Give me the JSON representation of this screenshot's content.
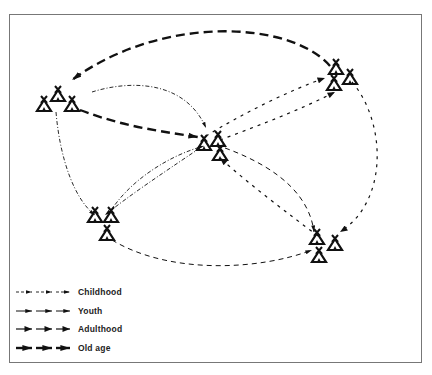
{
  "diagram": {
    "nodes": [
      {
        "id": "A",
        "name": "settlement-top-left",
        "x": 58,
        "y": 100
      },
      {
        "id": "B",
        "name": "settlement-top-right",
        "x": 342,
        "y": 75
      },
      {
        "id": "C",
        "name": "settlement-center",
        "x": 212,
        "y": 143
      },
      {
        "id": "D",
        "name": "settlement-bottom-left",
        "x": 103,
        "y": 225
      },
      {
        "id": "E",
        "name": "settlement-bottom-right",
        "x": 325,
        "y": 245
      }
    ],
    "edges": [
      {
        "from": "B",
        "to": "A",
        "stage": "old_age"
      },
      {
        "from": "A",
        "to": "C",
        "stage": "old_age"
      },
      {
        "from": "C",
        "to": "B",
        "stage": "adulthood"
      },
      {
        "from": "C",
        "to": "B",
        "stage": "adulthood"
      },
      {
        "from": "B",
        "to": "E",
        "stage": "adulthood"
      },
      {
        "from": "E",
        "to": "C",
        "stage": "adulthood"
      },
      {
        "from": "C",
        "to": "E",
        "stage": "youth"
      },
      {
        "from": "D",
        "to": "E",
        "stage": "youth"
      },
      {
        "from": "A",
        "to": "C",
        "stage": "childhood"
      },
      {
        "from": "A",
        "to": "D",
        "stage": "childhood"
      },
      {
        "from": "D",
        "to": "C",
        "stage": "childhood"
      },
      {
        "from": "C",
        "to": "D",
        "stage": "childhood"
      }
    ]
  },
  "legend": {
    "items": [
      {
        "key": "childhood",
        "label": "Childhood"
      },
      {
        "key": "youth",
        "label": "Youth"
      },
      {
        "key": "adulthood",
        "label": "Adulthood"
      },
      {
        "key": "old_age",
        "label": "Old age"
      }
    ]
  }
}
